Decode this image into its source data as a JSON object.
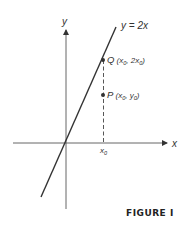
{
  "figure": {
    "caption": "FIGURE I",
    "axes": {
      "x_label": "x",
      "y_label": "y"
    },
    "line": {
      "equation": "y = 2x"
    },
    "points": [
      {
        "name": "Q",
        "coords": "(x0, 2x0)",
        "label_main": "Q",
        "label_open": " (x",
        "sub1": "0",
        "mid": ", 2x",
        "sub2": "0",
        "label_close": ")"
      },
      {
        "name": "P",
        "coords": "(x0, y0)",
        "label_main": "P",
        "label_open": " (x",
        "sub1": "0",
        "mid": ", y",
        "sub2": "0",
        "label_close": ")"
      }
    ],
    "x_tick": {
      "label": "x",
      "sub": "0"
    },
    "colors": {
      "stroke": "#333333",
      "axis": "#555555",
      "text": "#333333"
    }
  }
}
